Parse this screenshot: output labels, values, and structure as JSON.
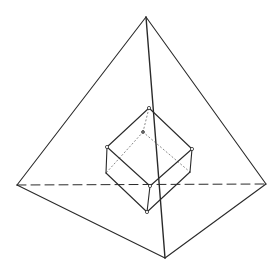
{
  "diagram": {
    "colors": {
      "stroke": "#2a2a2a",
      "hidden": "#8a8a8a",
      "background": "#ffffff"
    },
    "tetrahedron": {
      "vertices": {
        "apex": [
          146,
          17
        ],
        "left": [
          17,
          185
        ],
        "right": [
          266,
          184
        ],
        "bottom": [
          165,
          258
        ]
      },
      "visible_edges": [
        [
          "apex",
          "left"
        ],
        [
          "apex",
          "right"
        ],
        [
          "apex",
          "bottom"
        ],
        [
          "left",
          "bottom"
        ],
        [
          "right",
          "bottom"
        ]
      ],
      "hidden_edges": [
        [
          "left",
          "right"
        ]
      ]
    },
    "cube": {
      "vertices": {
        "top": [
          149,
          108
        ],
        "left": [
          107,
          147
        ],
        "right": [
          192,
          149
        ],
        "front": [
          150,
          186
        ],
        "left_lower": [
          106,
          173
        ],
        "right_lower": [
          190,
          172
        ],
        "bottom": [
          147,
          212
        ],
        "back": [
          143,
          132
        ]
      },
      "visible_edges": [
        [
          "top",
          "left"
        ],
        [
          "top",
          "right"
        ],
        [
          "left",
          "front"
        ],
        [
          "right",
          "front"
        ],
        [
          "left",
          "left_lower"
        ],
        [
          "front",
          "bottom"
        ],
        [
          "right",
          "right_lower"
        ],
        [
          "left_lower",
          "bottom"
        ],
        [
          "right_lower",
          "bottom"
        ]
      ],
      "hidden_edges": [
        [
          "back",
          "top"
        ],
        [
          "back",
          "left_lower"
        ],
        [
          "back",
          "right_lower"
        ]
      ]
    }
  }
}
